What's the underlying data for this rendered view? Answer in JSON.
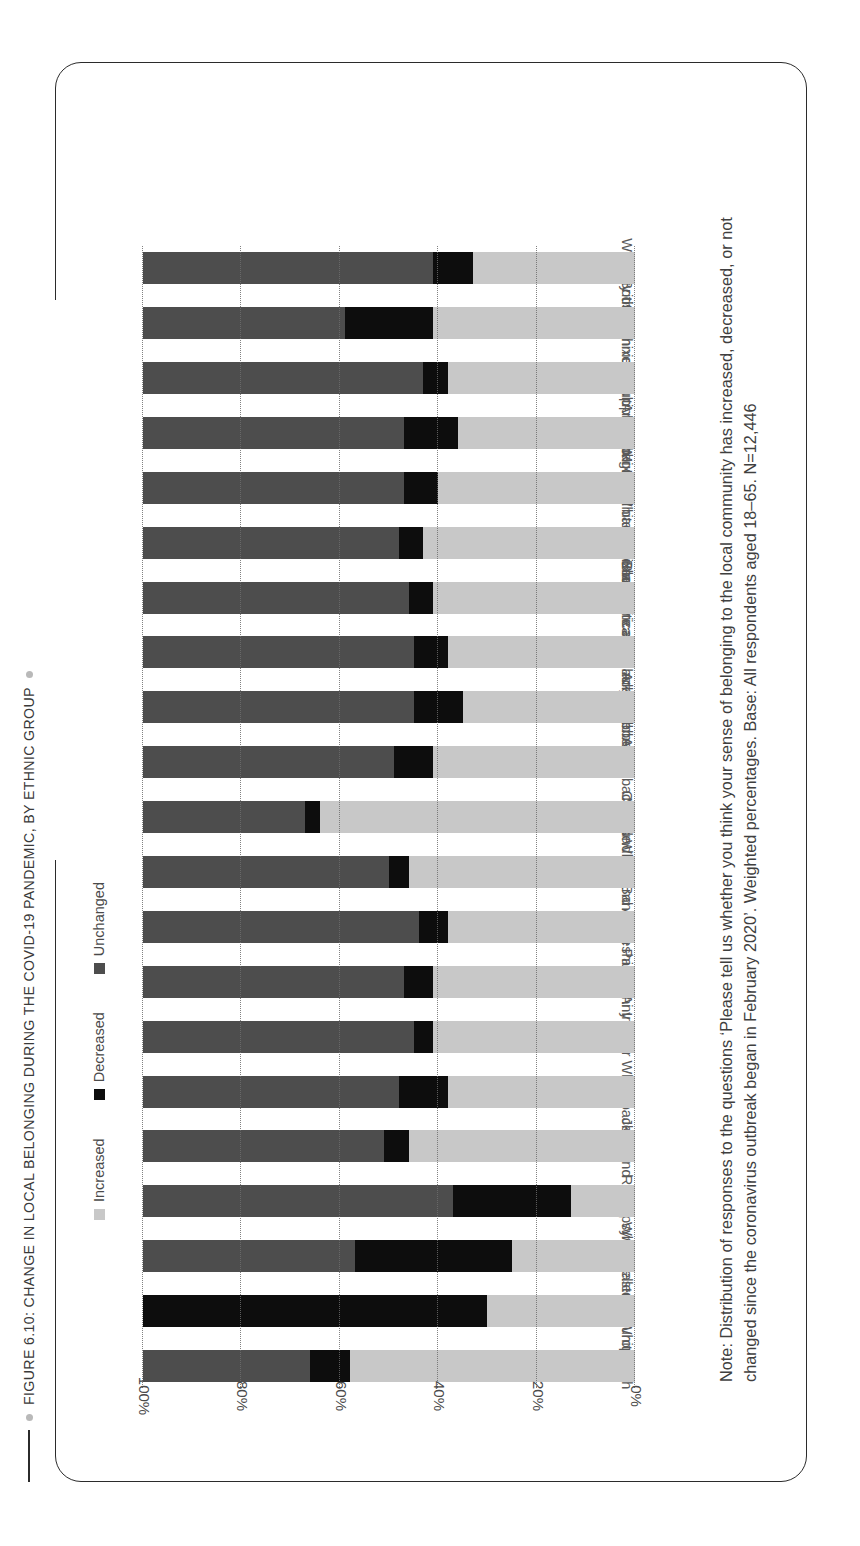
{
  "figure": {
    "title": "FIGURE 6.10: CHANGE IN LOCAL BELONGING DURING THE COVID-19 PANDEMIC, BY ETHNIC GROUP",
    "note": "Note: Distribution of responses to the questions ‘Please tell us whether you think your sense of belonging to the local community has increased, decreased, or not changed since the coronavirus outbreak began in February 2020’. Weighted percentages. Base: All respondents aged 18–65. N=12,446"
  },
  "colors": {
    "increased": "#c8c8c8",
    "decreased": "#0d0d0d",
    "unchanged": "#4d4d4d",
    "frame": "#2b2b2b",
    "gridline": "#6d6d6d",
    "text": "#4a4a4a"
  },
  "chart_data": {
    "type": "bar",
    "stacked": true,
    "orientation": "vertical",
    "title": "FIGURE 6.10: CHANGE IN LOCAL BELONGING DURING THE COVID-19 PANDEMIC, BY ETHNIC GROUP",
    "xlabel": "",
    "ylabel": "",
    "ylim": [
      0,
      100
    ],
    "yticks": [
      0,
      20,
      40,
      60,
      80,
      100
    ],
    "ytick_labels": [
      "0%",
      "20%",
      "40%",
      "60%",
      "80%",
      "100%"
    ],
    "grid": true,
    "legend_position": "top",
    "legend": [
      "Increased",
      "Decreased",
      "Unchanged"
    ],
    "categories": [
      "White Irish",
      "White Eastern European",
      "Gypsy/Traveller",
      "Roma",
      "Jewish",
      "Any other White background",
      "Indian",
      "Pakistani",
      "Bangladeshi",
      "Mixed White and Asian",
      "Chinese",
      "Any other Asian background",
      "Black Caribbean",
      "Mixed White and Black Caribbean",
      "Black African",
      "Mixed White and Black African",
      "Any other Black background",
      "Arab",
      "Any other mixed/multiple background",
      "Any other ethnic group",
      "White British"
    ],
    "series": [
      {
        "name": "Increased",
        "color": "#c8c8c8",
        "values": [
          58,
          30,
          25,
          13,
          46,
          38,
          41,
          41,
          38,
          46,
          64,
          41,
          35,
          38,
          41,
          43,
          40,
          36,
          38,
          41,
          33
        ]
      },
      {
        "name": "Decreased",
        "color": "#0d0d0d",
        "values": [
          8,
          70,
          32,
          24,
          5,
          10,
          4,
          6,
          6,
          4,
          3,
          8,
          10,
          7,
          5,
          5,
          7,
          11,
          5,
          18,
          8
        ]
      },
      {
        "name": "Unchanged",
        "color": "#4d4d4d",
        "values": [
          34,
          0,
          43,
          63,
          49,
          52,
          55,
          53,
          56,
          50,
          33,
          51,
          55,
          55,
          54,
          52,
          53,
          53,
          57,
          41,
          59
        ]
      }
    ]
  },
  "legend": {
    "items": [
      {
        "label": "Increased",
        "color": "#c8c8c8",
        "key": "increased"
      },
      {
        "label": "Decreased",
        "color": "#0d0d0d",
        "key": "decreased"
      },
      {
        "label": "Unchanged",
        "color": "#4d4d4d",
        "key": "unchanged"
      }
    ]
  }
}
